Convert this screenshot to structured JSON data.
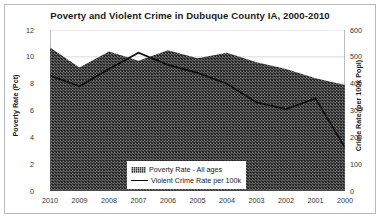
{
  "chart_data": {
    "type": "area",
    "title": "Poverty and Violent Crime in Dubuque County IA, 2000-2010",
    "categories": [
      "2010",
      "2009",
      "2008",
      "2007",
      "2006",
      "2005",
      "2004",
      "2003",
      "2002",
      "2001",
      "2000"
    ],
    "xlabel": "",
    "grid": true,
    "legend_position": "bottom-center",
    "axes": {
      "left": {
        "label": "Poverty Rate (Pct)",
        "ticks": [
          "0",
          "2",
          "4",
          "6",
          "8",
          "10",
          "12"
        ],
        "lim": [
          0,
          12
        ]
      },
      "right": {
        "label": "Crime Rate (per 100k Popl)",
        "ticks": [
          "0",
          "100",
          "200",
          "300",
          "400",
          "500",
          "600"
        ],
        "lim": [
          0,
          600
        ]
      }
    },
    "series": [
      {
        "name": "Poverty Rate - All ages",
        "type": "area",
        "axis": "left",
        "color": "#3c3c3c",
        "values": [
          10.7,
          9.2,
          10.4,
          9.7,
          10.5,
          9.9,
          10.3,
          9.6,
          9.1,
          8.4,
          7.9
        ]
      },
      {
        "name": "Violent Crime Rate per 100k",
        "type": "line",
        "axis": "right",
        "color": "#0d0d0d",
        "values": [
          430,
          390,
          455,
          515,
          470,
          440,
          400,
          330,
          305,
          345,
          162
        ]
      }
    ]
  },
  "legend": {
    "items": [
      {
        "label": "Poverty Rate - All ages",
        "marker": "area-swatch"
      },
      {
        "label": "Violent Crime Rate per 100k",
        "marker": "line-swatch"
      }
    ]
  }
}
